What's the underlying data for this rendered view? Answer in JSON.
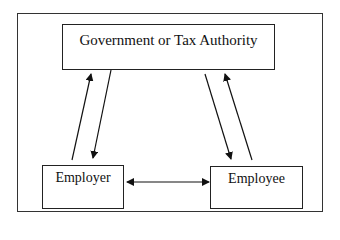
{
  "diagram": {
    "nodes": {
      "government": {
        "label": "Government or Tax Authority"
      },
      "employer": {
        "label": "Employer"
      },
      "employee": {
        "label": "Employee"
      }
    },
    "edges": [
      {
        "from": "employer",
        "to": "government",
        "type": "single-arrow"
      },
      {
        "from": "government",
        "to": "employer",
        "type": "single-arrow"
      },
      {
        "from": "government",
        "to": "employee",
        "type": "single-arrow"
      },
      {
        "from": "employee",
        "to": "government",
        "type": "single-arrow"
      },
      {
        "from": "employer",
        "to": "employee",
        "type": "double-arrow"
      }
    ]
  }
}
